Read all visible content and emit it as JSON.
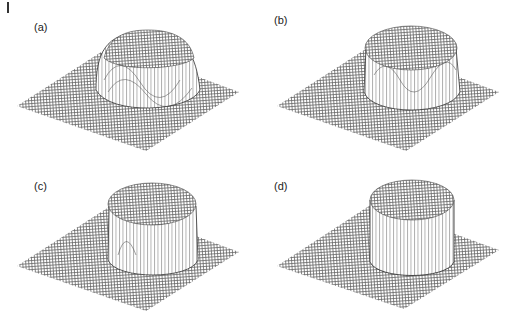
{
  "figure": {
    "panels": [
      {
        "id": "a",
        "label": "(a)",
        "shape": "smooth-gaussian-bump",
        "description": "Smooth rounded bump on flat mesh plane"
      },
      {
        "id": "b",
        "label": "(b)",
        "shape": "steeper-flat-top",
        "description": "Flat-top bump with steeper sides and ringing"
      },
      {
        "id": "c",
        "label": "(c)",
        "shape": "near-cylinder",
        "description": "Nearly cylindrical plateau with faint ringing"
      },
      {
        "id": "d",
        "label": "(d)",
        "shape": "cylinder",
        "description": "Sharp cylinder on flat mesh plane"
      }
    ]
  },
  "colors": {
    "mesh": "#555555",
    "background": "#ffffff",
    "wall": "#ffffff",
    "label": "#222222"
  }
}
